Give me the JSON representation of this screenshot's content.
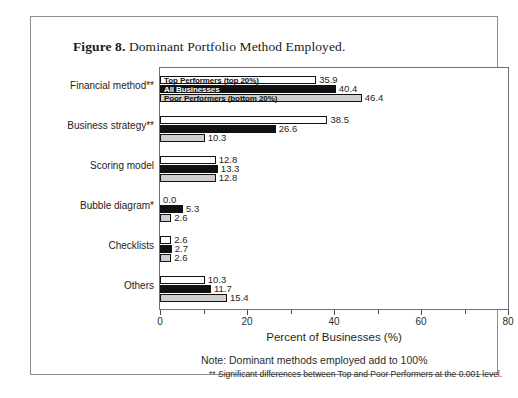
{
  "figure": {
    "caption_label": "Figure 8.",
    "caption_text": " Dominant Portfolio Method Employed."
  },
  "notes": {
    "line1": "Note: Dominant methods employed add to 100%",
    "line2": "** Significant differences between Top and Poor Performers at the 0.001 level."
  },
  "colors": {
    "series_top_performers": "#ffffff",
    "series_all_businesses": "#111111",
    "series_poor_performers": "#cfcfcf",
    "bar_outline": "#111111",
    "frame": "#8d8d8d",
    "plot_frame": "#6f6f6f"
  },
  "chart_data": {
    "type": "bar",
    "orientation": "horizontal",
    "title": "Dominant Portfolio Method Employed.",
    "xlabel": "Percent of Businesses (%)",
    "ylabel": "",
    "xlim": [
      0,
      80
    ],
    "xticks": [
      0,
      20,
      40,
      60,
      80
    ],
    "xtick_labels": [
      "0",
      "20",
      "40",
      "60",
      "80"
    ],
    "xminor_ticks": [
      10,
      30,
      50,
      70
    ],
    "grid": false,
    "legend_position": "inside-first-group",
    "categories": [
      "Financial method**",
      "Business strategy**",
      "Scoring model",
      "Bubble diagram*",
      "Checklists",
      "Others"
    ],
    "series": [
      {
        "name": "Top Performers (top 20%)",
        "color": "#ffffff",
        "values": [
          35.9,
          38.5,
          12.8,
          0.0,
          2.6,
          10.3
        ],
        "labels": [
          "35.9",
          "38.5",
          "12.8",
          "0.0",
          "2.6",
          "10.3"
        ]
      },
      {
        "name": "All Businesses",
        "color": "#111111",
        "values": [
          40.4,
          26.6,
          13.3,
          5.3,
          2.7,
          11.7
        ],
        "labels": [
          "40.4",
          "26.6",
          "13.3",
          "5.3",
          "2.7",
          "11.7"
        ]
      },
      {
        "name": "Poor Performers (bottom 20%)",
        "color": "#cfcfcf",
        "values": [
          46.4,
          10.3,
          12.8,
          2.6,
          2.6,
          15.4
        ],
        "labels": [
          "46.4",
          "10.3",
          "12.8",
          "2.6",
          "2.6",
          "15.4"
        ]
      }
    ],
    "annotations": [
      "Note: Dominant methods employed add to 100%",
      "** Significant differences between Top and Poor Performers at the 0.001 level."
    ]
  }
}
